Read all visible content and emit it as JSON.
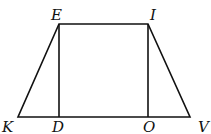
{
  "figure": {
    "shape": "trapezoid with two perpendicular heights",
    "labels": {
      "E": "E",
      "I": "I",
      "K": "K",
      "D": "D",
      "O": "O",
      "V": "V"
    },
    "colors": {
      "stroke": "#111111",
      "background": "#ffffff"
    }
  }
}
